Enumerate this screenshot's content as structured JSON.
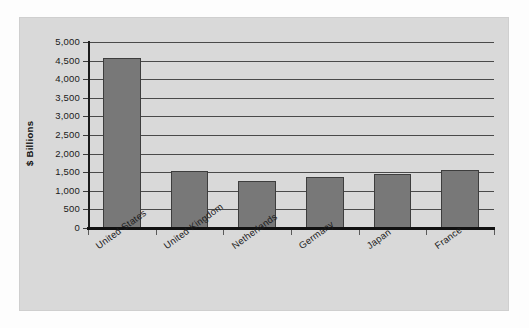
{
  "chart_data": {
    "type": "bar",
    "title": "",
    "xlabel": "",
    "ylabel": "$ Billions",
    "categories": [
      "United States",
      "United Kingdom",
      "Netherlands",
      "Germany",
      "Japan",
      "France"
    ],
    "values": [
      4580,
      1540,
      1270,
      1380,
      1450,
      1570
    ],
    "ylim": [
      0,
      5000
    ],
    "ytick_values": [
      0,
      500,
      1000,
      1500,
      2000,
      2500,
      3000,
      3500,
      4000,
      4500,
      5000
    ],
    "ytick_labels": [
      "0",
      "500",
      "1,000",
      "1,500",
      "2,000",
      "2,500",
      "3,000",
      "3,500",
      "4,000",
      "4,500",
      "5,000"
    ],
    "grid": true,
    "grid_axis": "y",
    "legend": false,
    "legend_position": "none",
    "bar_color": "#787878",
    "bar_edge_color": "#3d3d3d",
    "panel_background": "#d9d9d9",
    "figure_background": "#fdfdfd",
    "axis_color": "#111111",
    "gridline_color": "#4a4a4a",
    "text_color": "#1a1a1a",
    "x_label_rotation": -36
  }
}
